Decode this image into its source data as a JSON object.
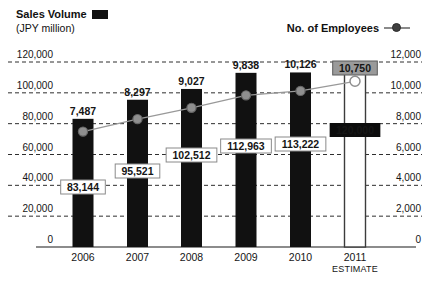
{
  "legend": {
    "sales_label": "Sales Volume",
    "sales_unit": "(JPY million)",
    "employees_label": "No. of Employees"
  },
  "colors": {
    "bar": "#111111",
    "estimate_bar_fill": "#ffffff",
    "estimate_bar_stroke": "#3c3c3c",
    "line": "#999999",
    "marker_fill": "#8f8f8f",
    "marker_stroke": "#666666",
    "estimate_marker_stroke": "#8f8f8f",
    "grid": "#2e2e2e",
    "baseline": "#8c8c8c",
    "value_box_bg": "#ffffff",
    "value_box_border": "#8a8a8a",
    "estimate_value_box_bg": "#9a9a9a",
    "final_box_bg": "#0c0c0c",
    "final_box_text": "#ffffff",
    "text": "#151515"
  },
  "chart_data": {
    "type": "bar",
    "subtype": "bar+line combo with dual y-axes",
    "categories": [
      "2006",
      "2007",
      "2008",
      "2009",
      "2010",
      "2011"
    ],
    "estimate_index": 5,
    "estimate_sub_label": "ESTIMATE",
    "series": [
      {
        "name": "Sales Volume",
        "unit": "JPY million",
        "type": "bar",
        "axis": "left",
        "values": [
          83144,
          95521,
          102512,
          112963,
          113222,
          120000
        ],
        "value_labels": [
          "83,144",
          "95,521",
          "102,512",
          "112,963",
          "113,222",
          "120,000"
        ]
      },
      {
        "name": "No. of Employees",
        "type": "line",
        "axis": "right",
        "values": [
          7487,
          8297,
          9027,
          9838,
          10126,
          10750
        ],
        "value_labels": [
          "7,487",
          "8,297",
          "9,027",
          "9,838",
          "10,126",
          "10,750"
        ]
      }
    ],
    "left_axis": {
      "range": [
        0,
        120000
      ],
      "ticks": [
        "120,000",
        "100,000",
        "80,000",
        "60,000",
        "40,000",
        "20,000",
        "0"
      ]
    },
    "right_axis": {
      "range": [
        0,
        12000
      ],
      "ticks": [
        "12,000",
        "10,000",
        "8,000",
        "6,000",
        "4,000",
        "2,000",
        "0"
      ]
    },
    "grid": "horizontal dashed lines at every tick, solid baseline at 0",
    "legend_position": "top",
    "layout_hints": {
      "plot_top": 62,
      "plot_bottom": 247,
      "grid_x": [
        8,
        422
      ],
      "baseline_x": [
        36,
        416
      ],
      "left_tick_x": 53,
      "right_tick_x": 421,
      "bar_width": 21,
      "bar_centers": [
        83,
        137.5,
        191.5,
        246,
        300.5,
        355
      ],
      "sales_label_y": [
        187,
        171,
        155,
        146,
        144,
        130
      ],
      "year_label_y": 261,
      "estimate_sub_label_y": 272
    }
  }
}
